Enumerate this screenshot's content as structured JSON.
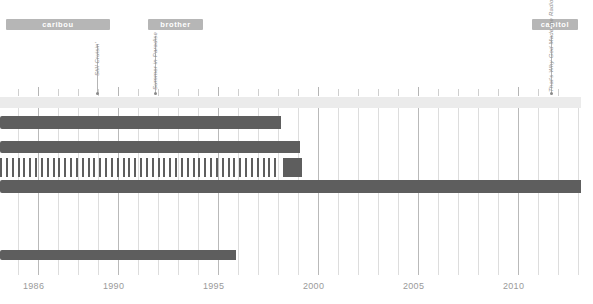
{
  "chart_data": {
    "type": "bar",
    "title": "",
    "subtitle": "",
    "xlabel": "",
    "ylabel": "",
    "orientation": "horizontal-timeline",
    "grid": true,
    "legend_position": "none",
    "xlim": [
      1985.0,
      2012.0
    ],
    "x_tick_labels": [
      "1986",
      "1990",
      "1995",
      "2000",
      "2005",
      "2010"
    ],
    "x_tick_values": [
      1986,
      1990,
      1995,
      2000,
      2005,
      2010
    ],
    "minor_tick_step": 1,
    "colors": {
      "bar": "#5e5e5e",
      "band": "#ebebeb",
      "chip": "#b6b6b6",
      "gridline": "#dddddd",
      "gridline_major": "#b9b9b9",
      "tick": "#cfcfcf",
      "text": "#9a9a9a",
      "annotation": "#8d8d8d"
    },
    "label_chips": [
      {
        "label": "caribou",
        "start": 1985.0,
        "end": 1990.0
      },
      {
        "label": "brother",
        "start": 1991.4,
        "end": 1994.2
      },
      {
        "label": "capitol",
        "start": 2009.9,
        "end": 2012.0
      }
    ],
    "annotations": [
      {
        "label": "Still Cruisin'",
        "year": 1989.0
      },
      {
        "label": "Summer in Paradise",
        "year": 1992.0
      },
      {
        "label": "That's Why God Made the Radio",
        "year": 2011.6
      }
    ],
    "series": [
      {
        "name": "header-band",
        "kind": "band",
        "start": 1985.0,
        "end": 2011.8,
        "row": 0
      },
      {
        "name": "era-bar-1",
        "kind": "bar",
        "start": 1985.0,
        "end": 1998.0,
        "row": 1
      },
      {
        "name": "era-bar-2",
        "kind": "bar",
        "start": 1985.0,
        "end": 1999.0,
        "row": 2
      },
      {
        "name": "tour-stripes",
        "kind": "stripes",
        "start": 1985.0,
        "end": 1997.3,
        "row": 3,
        "stripe_count": 48
      },
      {
        "name": "tour-block",
        "kind": "bar",
        "start": 1997.9,
        "end": 1999.0,
        "row": 3
      },
      {
        "name": "era-bar-3",
        "kind": "bar",
        "start": 1985.0,
        "end": 2011.9,
        "row": 4
      },
      {
        "name": "era-bar-4",
        "kind": "bar",
        "start": 1985.0,
        "end": 1996.1,
        "row": 5
      }
    ]
  },
  "axis": {
    "years": [
      "1986",
      "1990",
      "1995",
      "2000",
      "2005",
      "2010"
    ]
  },
  "chips": {
    "caribou": "caribou",
    "brother": "brother",
    "capitol": "capitol"
  },
  "annotations": {
    "a1": "Still Cruisin'",
    "a2": "Summer in Paradise",
    "a3": "That's Why God Made the Radio"
  }
}
